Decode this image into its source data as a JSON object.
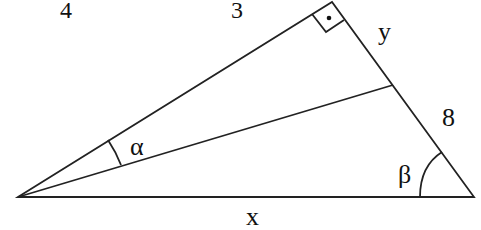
{
  "diagram": {
    "type": "right-triangle-geometry",
    "stroke_color": "#222222",
    "background": "#ffffff",
    "vertices": {
      "left": [
        18,
        197
      ],
      "top_right_angle": [
        332,
        2
      ],
      "bottom_right": [
        474,
        197
      ]
    },
    "inner_segment_end": [
      393,
      85
    ],
    "labels": {
      "top_left_number": "4",
      "top_number": "3",
      "side_y": "y",
      "side_8": "8",
      "base_x": "x",
      "angle_alpha": "α",
      "angle_beta": "β"
    },
    "right_angle_marker": "square-with-dot"
  }
}
